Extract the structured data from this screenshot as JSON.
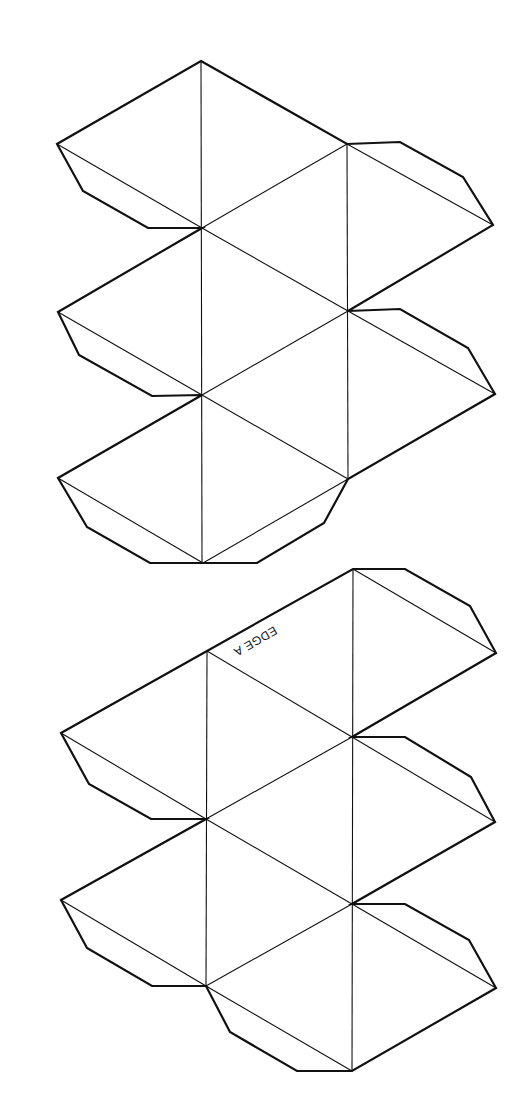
{
  "labels": {
    "edge_a": "EDGE A"
  },
  "colors": {
    "line": "#111111",
    "background": "#ffffff"
  },
  "nets": [
    {
      "name": "upper-net",
      "cut_outline": "201,61 347,144 400,142 463,177 493,225 348,311 400,309 468,348 495,394 348,479 324,523 257,563 203,563 150,563 87,527 58,478 202,395 152,396 79,355 58,312 202,228 148,228 83,191 57,144",
      "fold_lines": [
        "201,61 202,563",
        "347,144 348,479",
        "57,144 202,228",
        "202,228 347,144",
        "347,144 493,225",
        "202,228 348,311",
        "58,312 202,395",
        "202,395 348,311",
        "348,311 495,394",
        "202,395 348,479",
        "58,478 203,563",
        "203,563 348,479"
      ]
    },
    {
      "name": "lower-net",
      "cut_outline": "353,569 405,569 470,606 496,653 352,737 405,737 471,777 495,822 352,904 405,904 469,940 496,988 352,1071 297,1071 230,1032 206,986 152,986 87,948 61,900 206,819 151,819 89,784 61,733 207,651",
      "fold_lines": [
        "207,651 206,986",
        "353,569 352,1071",
        "353,569 496,653",
        "207,651 352,737",
        "61,733 206,819",
        "206,819 352,737",
        "352,737 495,822",
        "206,819 352,904",
        "61,900 206,986",
        "206,986 352,904",
        "352,904 496,988",
        "206,986 352,1071"
      ]
    }
  ]
}
